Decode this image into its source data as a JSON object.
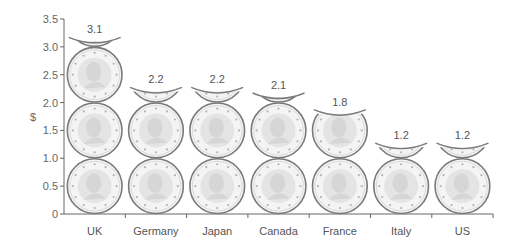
{
  "chart_data": {
    "type": "bar",
    "style": "pictograph-coins",
    "title": "",
    "xlabel": "",
    "ylabel": "$",
    "categories": [
      "UK",
      "Germany",
      "Japan",
      "Canada",
      "France",
      "Italy",
      "US"
    ],
    "values": [
      3.1,
      2.2,
      2.2,
      2.1,
      1.8,
      1.2,
      1.2
    ],
    "value_labels": [
      "3.1",
      "2.2",
      "2.2",
      "2.1",
      "1.8",
      "1.2",
      "1.2"
    ],
    "ylim": [
      0,
      3.5
    ],
    "yticks": [
      0,
      0.5,
      1.0,
      1.5,
      2.0,
      2.5,
      3.0,
      3.5
    ],
    "ytick_labels": [
      "0",
      "0.5",
      "1.0",
      "1.5",
      "2.0",
      "2.5",
      "3.0",
      "3.5"
    ],
    "unit_per_coin": 1.0,
    "grid": false,
    "legend": null
  },
  "colors": {
    "axis": "#666666",
    "coin_rim": "#7a7a7a",
    "coin_face": "#e4e4e4",
    "coin_inner": "#d6d6d6",
    "coin_star": "#b5b5b5"
  }
}
